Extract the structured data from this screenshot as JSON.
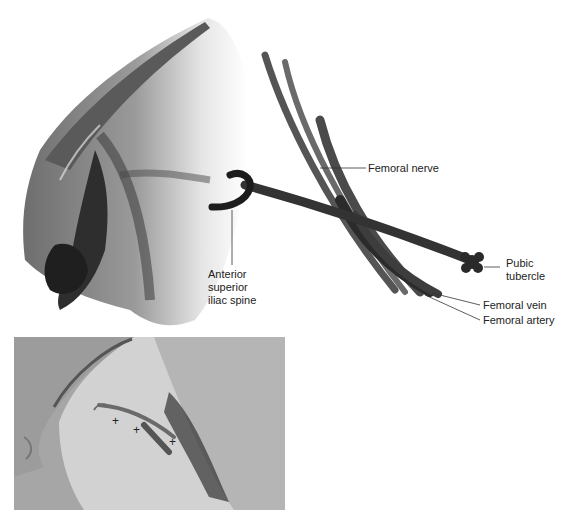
{
  "figure": {
    "illustration": {
      "labels": {
        "femoral_nerve": "Femoral nerve",
        "asis_line1": "Anterior",
        "asis_line2": "superior",
        "asis_line3": "iliac spine",
        "pubic_line1": "Pubic",
        "pubic_line2": "tubercle",
        "femoral_vein": "Femoral vein",
        "femoral_artery": "Femoral artery"
      }
    },
    "photo": {
      "markers": [
        "+",
        "+",
        "+"
      ]
    },
    "colors": {
      "background": "#ffffff",
      "ink": "#222222",
      "shading_dark": "#2b2b2b",
      "shading_mid": "#7a7a7a",
      "shading_light": "#bdbdbd",
      "drape": "#a8a8a8",
      "skin": "#cfcfcf"
    }
  }
}
